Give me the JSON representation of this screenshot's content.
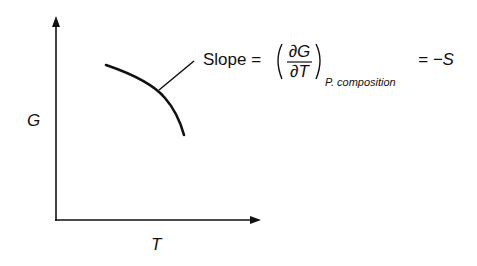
{
  "diagram": {
    "y_axis_label": "G",
    "x_axis_label": "T",
    "annotation": {
      "prefix": "Slope =",
      "numerator": "∂G",
      "denominator": "∂T",
      "subscript": "P. composition",
      "result": "= −S"
    }
  },
  "colors": {
    "ink": "#111111",
    "background": "#ffffff"
  }
}
